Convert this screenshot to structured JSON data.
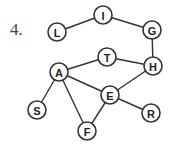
{
  "problem_number": "4.",
  "graph": {
    "nodes": [
      {
        "id": "L",
        "label": "L",
        "x": 57,
        "y": 32
      },
      {
        "id": "I",
        "label": "I",
        "x": 103,
        "y": 15
      },
      {
        "id": "G",
        "label": "G",
        "x": 152,
        "y": 30
      },
      {
        "id": "T",
        "label": "T",
        "x": 107,
        "y": 57
      },
      {
        "id": "H",
        "label": "H",
        "x": 153,
        "y": 66
      },
      {
        "id": "A",
        "label": "A",
        "x": 59,
        "y": 72
      },
      {
        "id": "E",
        "label": "E",
        "x": 110,
        "y": 95
      },
      {
        "id": "S",
        "label": "S",
        "x": 37,
        "y": 110
      },
      {
        "id": "R",
        "label": "R",
        "x": 151,
        "y": 113
      },
      {
        "id": "F",
        "label": "F",
        "x": 87,
        "y": 131
      }
    ],
    "edges": [
      [
        "L",
        "I"
      ],
      [
        "I",
        "G"
      ],
      [
        "G",
        "H"
      ],
      [
        "T",
        "H"
      ],
      [
        "A",
        "T"
      ],
      [
        "A",
        "E"
      ],
      [
        "E",
        "H"
      ],
      [
        "A",
        "S"
      ],
      [
        "A",
        "F"
      ],
      [
        "E",
        "F"
      ],
      [
        "E",
        "R"
      ]
    ]
  }
}
